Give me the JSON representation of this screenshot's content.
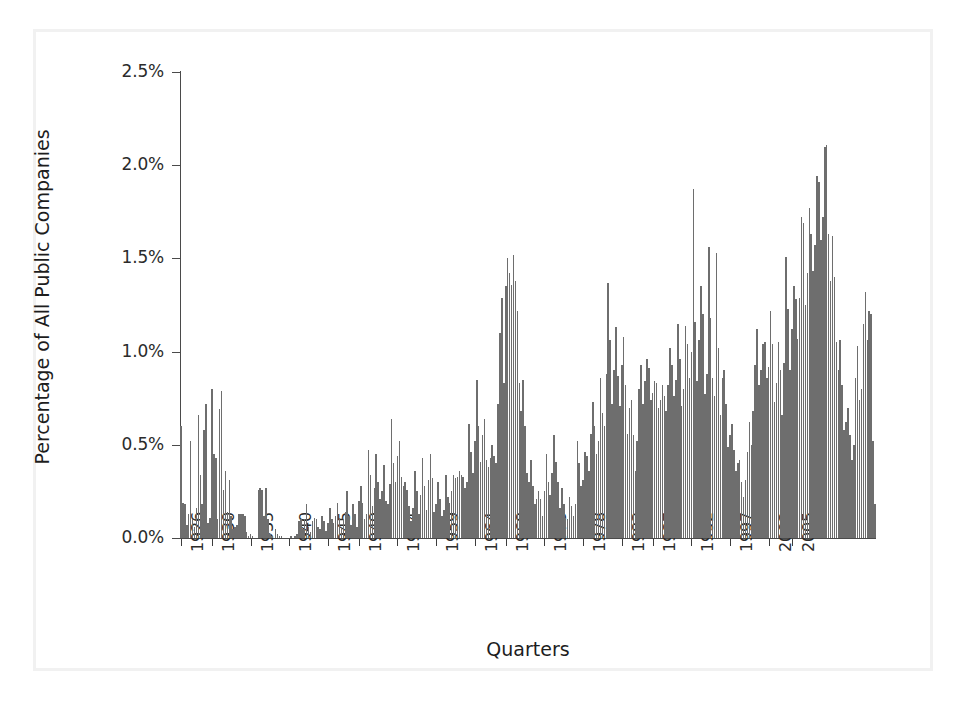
{
  "chart_data": {
    "type": "bar",
    "title": "",
    "xlabel": "Quarters",
    "ylabel": "Percentage of All Public Companies",
    "ylim": [
      0,
      2.5
    ],
    "yticks": [
      0,
      0.5,
      1.0,
      1.5,
      2.0,
      2.5
    ],
    "ytick_labels": [
      "0.0%",
      "0.5%",
      "1.0%",
      "1.5%",
      "2.0%",
      "2.5%"
    ],
    "xtick_labels": [
      "1926",
      "1930",
      "1935",
      "1940",
      "1945",
      "1949",
      "1954",
      "1959",
      "1964",
      "1968",
      "1973",
      "1978",
      "1983",
      "1987",
      "1992",
      "1997",
      "2002",
      "2005"
    ],
    "xtick_years": [
      1926,
      1930,
      1935,
      1940,
      1945,
      1949,
      1954,
      1959,
      1964,
      1968,
      1973,
      1978,
      1983,
      1987,
      1992,
      1997,
      2002,
      2005
    ],
    "x_start_year": 1926,
    "x_end_year": 2005.75,
    "quarters_per_year": 4,
    "grid": false,
    "legend": false,
    "bar_color": "#6e6e6e",
    "axis_color": "#4a4a4a",
    "values": [
      0.6,
      0.19,
      0.18,
      0.07,
      0.13,
      0.52,
      0.1,
      0.06,
      0.16,
      0.66,
      0.34,
      0.18,
      0.58,
      0.72,
      0.08,
      0.11,
      0.8,
      0.45,
      0.43,
      0.1,
      0.69,
      0.79,
      0.26,
      0.36,
      0.14,
      0.31,
      0.12,
      0.05,
      0.06,
      0.07,
      0.13,
      0.13,
      0.13,
      0.12,
      0.03,
      0.01,
      0.02,
      0.01,
      0.0,
      0.0,
      0.26,
      0.27,
      0.26,
      0.12,
      0.27,
      0.1,
      0.02,
      0.01,
      0.0,
      0.05,
      0.02,
      0.01,
      0.01,
      0.0,
      0.0,
      0.0,
      0.0,
      0.01,
      0.0,
      0.01,
      0.02,
      0.09,
      0.1,
      0.05,
      0.1,
      0.18,
      0.06,
      0.03,
      0.09,
      0.11,
      0.1,
      0.06,
      0.05,
      0.12,
      0.09,
      0.04,
      0.08,
      0.16,
      0.1,
      0.08,
      0.12,
      0.19,
      0.11,
      0.06,
      0.1,
      0.14,
      0.25,
      0.12,
      0.07,
      0.18,
      0.13,
      0.06,
      0.2,
      0.28,
      0.19,
      0.1,
      0.13,
      0.47,
      0.34,
      0.17,
      0.27,
      0.45,
      0.3,
      0.21,
      0.25,
      0.39,
      0.2,
      0.18,
      0.29,
      0.64,
      0.4,
      0.3,
      0.44,
      0.52,
      0.33,
      0.28,
      0.3,
      0.26,
      0.17,
      0.09,
      0.16,
      0.36,
      0.25,
      0.13,
      0.23,
      0.43,
      0.28,
      0.15,
      0.31,
      0.45,
      0.32,
      0.14,
      0.18,
      0.3,
      0.21,
      0.12,
      0.15,
      0.34,
      0.22,
      0.19,
      0.25,
      0.34,
      0.32,
      0.33,
      0.36,
      0.34,
      0.33,
      0.27,
      0.3,
      0.61,
      0.46,
      0.35,
      0.52,
      0.85,
      0.6,
      0.41,
      0.55,
      0.64,
      0.42,
      0.38,
      0.43,
      0.5,
      0.44,
      0.4,
      0.72,
      1.1,
      1.29,
      0.83,
      1.35,
      1.5,
      1.42,
      1.36,
      1.52,
      1.38,
      1.22,
      0.83,
      0.68,
      0.85,
      0.6,
      0.35,
      0.3,
      0.42,
      0.28,
      0.18,
      0.21,
      0.25,
      0.21,
      0.12,
      0.25,
      0.45,
      0.3,
      0.23,
      0.35,
      0.55,
      0.41,
      0.3,
      0.16,
      0.27,
      0.18,
      0.11,
      0.1,
      0.22,
      0.17,
      0.12,
      0.18,
      0.52,
      0.4,
      0.28,
      0.31,
      0.46,
      0.44,
      0.36,
      0.56,
      0.73,
      0.6,
      0.45,
      0.52,
      0.86,
      0.67,
      0.6,
      0.88,
      1.37,
      1.06,
      0.72,
      0.9,
      1.13,
      0.87,
      0.71,
      0.93,
      1.08,
      0.82,
      0.56,
      0.7,
      0.74,
      0.55,
      0.36,
      0.52,
      0.8,
      0.93,
      0.72,
      0.84,
      0.96,
      0.91,
      0.74,
      0.78,
      0.84,
      0.83,
      0.7,
      0.74,
      0.82,
      0.76,
      0.68,
      0.82,
      1.02,
      0.93,
      0.76,
      0.85,
      1.15,
      0.96,
      0.71,
      0.8,
      1.14,
      1.04,
      0.86,
      1.0,
      1.87,
      1.16,
      0.84,
      1.06,
      1.35,
      1.2,
      0.77,
      0.88,
      1.56,
      1.18,
      0.86,
      0.76,
      1.53,
      1.02,
      0.66,
      0.86,
      0.9,
      0.72,
      0.49,
      0.55,
      0.61,
      0.47,
      0.36,
      0.4,
      0.42,
      0.3,
      0.22,
      0.31,
      0.46,
      0.62,
      0.5,
      0.68,
      0.93,
      1.12,
      0.82,
      0.9,
      1.04,
      1.05,
      0.86,
      0.92,
      1.22,
      1.04,
      0.73,
      0.83,
      1.05,
      0.9,
      0.66,
      0.94,
      1.51,
      1.23,
      0.9,
      1.12,
      1.35,
      1.28,
      1.07,
      1.29,
      1.72,
      1.69,
      1.25,
      1.42,
      1.77,
      1.63,
      1.43,
      1.57,
      1.94,
      1.91,
      1.6,
      1.72,
      2.1,
      2.11,
      1.63,
      1.38,
      1.62,
      1.4,
      1.05,
      0.9,
      1.06,
      0.82,
      0.58,
      0.62,
      0.7,
      0.55,
      0.42,
      0.5,
      0.86,
      1.03,
      0.74,
      0.8,
      1.15,
      1.32,
      1.06,
      1.22,
      1.2,
      0.52,
      0.18
    ]
  },
  "figure": {
    "background_color": "#ffffff",
    "frame_color": "#f1f1f1"
  }
}
